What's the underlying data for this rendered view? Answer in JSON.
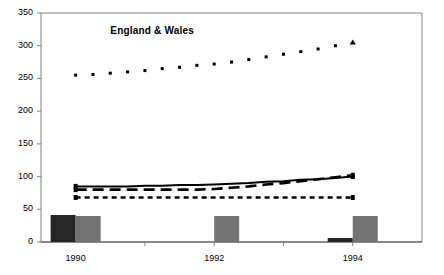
{
  "figure": {
    "cropped_header_text": "",
    "annotation_label": "England & Wales",
    "background_color": "#ffffff",
    "frame_color": "#808080"
  },
  "axes": {
    "y_ticks": [
      "0",
      "50",
      "100",
      "150",
      "200",
      "250",
      "300",
      "350"
    ],
    "x_ticks": [
      "1990",
      "1992",
      "1994"
    ]
  },
  "chart_data": {
    "type": "line",
    "title": "",
    "subtitle": "",
    "xlabel": "",
    "ylabel": "",
    "xlim": [
      1989.5,
      1995.0
    ],
    "ylim": [
      0,
      350
    ],
    "grid": false,
    "legend": "none",
    "annotations": [
      {
        "text": "England & Wales",
        "x": 1990.5,
        "y": 322
      }
    ],
    "x": [
      1990.0,
      1990.25,
      1990.5,
      1990.75,
      1991.0,
      1991.25,
      1991.5,
      1991.75,
      1992.0,
      1992.25,
      1992.5,
      1992.75,
      1993.0,
      1993.25,
      1993.5,
      1993.75,
      1994.0
    ],
    "series": [
      {
        "name": "England & Wales",
        "style": "dotted-markers",
        "marker": "square",
        "end_marker": "triangle",
        "color": "#000000",
        "values": [
          255,
          256,
          258,
          260,
          262,
          265,
          267,
          270,
          272,
          275,
          279,
          283,
          287,
          291,
          295,
          300,
          305
        ]
      },
      {
        "name": "series-solid",
        "style": "solid",
        "color": "#000000",
        "values": [
          85,
          85,
          85,
          85,
          86,
          86,
          87,
          87,
          88,
          89,
          90,
          92,
          93,
          95,
          96,
          98,
          100
        ]
      },
      {
        "name": "series-dashed",
        "style": "dashed",
        "color": "#000000",
        "values": [
          80,
          80,
          80,
          80,
          80,
          80,
          80,
          80,
          81,
          83,
          85,
          88,
          90,
          93,
          96,
          99,
          102
        ]
      },
      {
        "name": "series-dotted-flat",
        "style": "dotted",
        "color": "#000000",
        "values": [
          68,
          68,
          68,
          68,
          68,
          68,
          68,
          68,
          68,
          68,
          68,
          68,
          68,
          68,
          68,
          68,
          68
        ]
      }
    ],
    "bars": {
      "categories": [
        "1990",
        "1992",
        "1994"
      ],
      "series": [
        {
          "name": "bar-dark",
          "color": "#262626",
          "values": [
            27,
            0,
            4
          ]
        },
        {
          "name": "bar-gray",
          "color": "#737373",
          "values": [
            26,
            26,
            26
          ]
        }
      ]
    }
  }
}
